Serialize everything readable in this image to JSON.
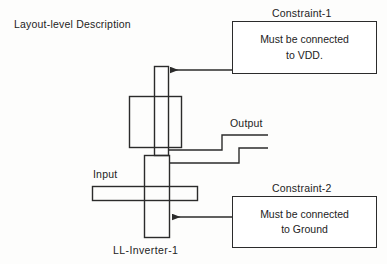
{
  "figure": {
    "title": "Layout-level Description",
    "cell_label": "LL-Inverter-1",
    "port_labels": {
      "output": "Output",
      "input": "Input"
    },
    "stroke_color": "#2b2b2b",
    "fill_color": "#ffffff",
    "background_color": "#fdfdfc"
  },
  "annotations": [
    {
      "title": "Constraint-1",
      "line1": "Must be connected",
      "line2": "to VDD.",
      "arrow": "left-arrow-icon"
    },
    {
      "title": "Constraint-2",
      "line1": "Must be connected",
      "line2": "to Ground",
      "arrow": "left-arrow-icon"
    }
  ]
}
